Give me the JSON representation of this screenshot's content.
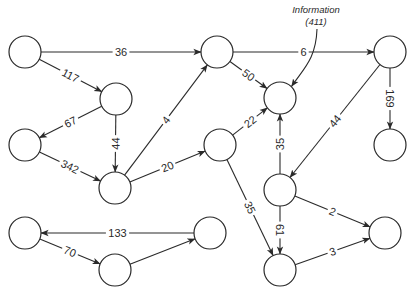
{
  "diagram": {
    "type": "directed-weighted-graph",
    "annotation": {
      "line1": "Information",
      "line2": "(411)",
      "target": "F"
    },
    "nodes": [
      "A",
      "B",
      "C",
      "D",
      "E",
      "F",
      "G",
      "H",
      "I",
      "J",
      "K",
      "L",
      "M",
      "N",
      "O"
    ],
    "edges": [
      {
        "from": "A",
        "to": "E",
        "weight": "36"
      },
      {
        "from": "A",
        "to": "B",
        "weight": "117"
      },
      {
        "from": "B",
        "to": "C",
        "weight": "67"
      },
      {
        "from": "B",
        "to": "D",
        "weight": "44"
      },
      {
        "from": "C",
        "to": "D",
        "weight": "342"
      },
      {
        "from": "D",
        "to": "E",
        "weight": "4"
      },
      {
        "from": "D",
        "to": "I",
        "weight": "20"
      },
      {
        "from": "E",
        "to": "G",
        "weight": "6"
      },
      {
        "from": "E",
        "to": "F",
        "weight": "50"
      },
      {
        "from": "I",
        "to": "F",
        "weight": "22"
      },
      {
        "from": "I",
        "to": "N",
        "weight": "35"
      },
      {
        "from": "G",
        "to": "H",
        "weight": "169"
      },
      {
        "from": "G",
        "to": "J",
        "weight": "44"
      },
      {
        "from": "J",
        "to": "F",
        "weight": "35"
      },
      {
        "from": "J",
        "to": "N",
        "weight": "61"
      },
      {
        "from": "J",
        "to": "O",
        "weight": "2"
      },
      {
        "from": "N",
        "to": "O",
        "weight": "3"
      },
      {
        "from": "M",
        "to": "K",
        "weight": "133"
      },
      {
        "from": "K",
        "to": "L",
        "weight": "70"
      },
      {
        "from": "L",
        "to": "M",
        "weight": ""
      }
    ]
  }
}
